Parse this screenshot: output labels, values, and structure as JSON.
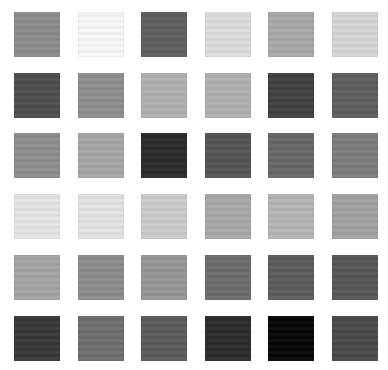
{
  "grid": {
    "rows": 6,
    "cols": 6,
    "origin_x": 14,
    "origin_y": 12,
    "step_x": 63.5,
    "step_y": 60.7,
    "cell_w": 46,
    "cell_h": 45,
    "cells": [
      [
        "#8c8c8c",
        "#f7f7f7",
        "#5e5e5e",
        "#dcdcdc",
        "#a8a8a8",
        "#d4d4d4"
      ],
      [
        "#4e4e4e",
        "#8e8e8e",
        "#b0b0b0",
        "#b0b0b0",
        "#404040",
        "#5e5e5e"
      ],
      [
        "#8e8e8e",
        "#a6a6a6",
        "#2a2a2a",
        "#545454",
        "#686868",
        "#7c7c7c"
      ],
      [
        "#e4e4e4",
        "#e2e2e2",
        "#cacaca",
        "#a8a8a8",
        "#b4b4b4",
        "#a2a2a2"
      ],
      [
        "#a4a4a4",
        "#8c8c8c",
        "#969696",
        "#6c6c6c",
        "#5c5c5c",
        "#565656"
      ],
      [
        "#383838",
        "#6e6e6e",
        "#5a5a5a",
        "#2c2c2c",
        "#060606",
        "#4a4a4a"
      ]
    ]
  }
}
